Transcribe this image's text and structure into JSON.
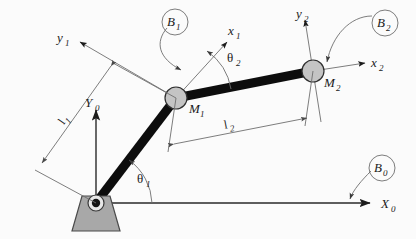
{
  "figure": {
    "background_color": "#fbfbfb",
    "link_color": "#0d0d0d",
    "joint_color": "#c4c4c4",
    "base_color": "#a8a8a8",
    "annotation_color": "#6e6e6e"
  },
  "labels": {
    "base_frame_x": {
      "main": "X",
      "sub": "0"
    },
    "base_frame_y": {
      "main": "Y",
      "sub": "0"
    },
    "frame1_x": {
      "main": "x",
      "sub": "1"
    },
    "frame1_y": {
      "main": "y",
      "sub": "1"
    },
    "frame2_x": {
      "main": "x",
      "sub": "2"
    },
    "frame2_y": {
      "main": "y",
      "sub": "2"
    },
    "body0": {
      "main": "B",
      "sub": "0"
    },
    "body1": {
      "main": "B",
      "sub": "1"
    },
    "body2": {
      "main": "B",
      "sub": "2"
    },
    "mass1": {
      "main": "M",
      "sub": "1"
    },
    "mass2": {
      "main": "M",
      "sub": "2"
    },
    "angle1": {
      "main": "θ",
      "sub": "1"
    },
    "angle2": {
      "main": "θ",
      "sub": "2"
    },
    "length1": {
      "main": "l",
      "sub": "1"
    },
    "length2": {
      "main": "l",
      "sub": "2"
    }
  },
  "geometry": {
    "base_pivot": {
      "x": 96,
      "y": 203
    },
    "joint_m1": {
      "x": 176,
      "y": 98
    },
    "joint_m2": {
      "x": 313,
      "y": 71
    },
    "link1_angle_deg": 53,
    "link2_angle_deg": 11,
    "joint_radius_m1": 11,
    "joint_radius_m2": 11
  }
}
